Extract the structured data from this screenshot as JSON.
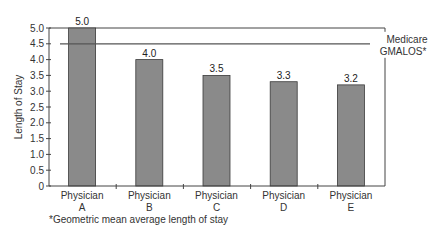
{
  "chart_data": {
    "type": "bar",
    "title": "",
    "xlabel": "",
    "ylabel": "Length of Stay",
    "ylim": [
      0,
      5.0
    ],
    "yticks": [
      "0",
      "0.5",
      "1.0",
      "1.5",
      "2.0",
      "2.5",
      "3.0",
      "3.5",
      "4.0",
      "4.5",
      "5.0"
    ],
    "categories": [
      {
        "line1": "Physician",
        "line2": "A"
      },
      {
        "line1": "Physician",
        "line2": "B"
      },
      {
        "line1": "Physician",
        "line2": "C"
      },
      {
        "line1": "Physician",
        "line2": "D"
      },
      {
        "line1": "Physician",
        "line2": "E"
      }
    ],
    "values": [
      5.0,
      4.0,
      3.5,
      3.3,
      3.2
    ],
    "value_labels": [
      "5.0",
      "4.0",
      "3.5",
      "3.3",
      "3.2"
    ],
    "reference_line": {
      "value": 4.5,
      "label_line1": "Medicare",
      "label_line2": "GMALOS*"
    },
    "footnote": "*Geometric mean average length of stay",
    "grid": false,
    "legend": "none",
    "colors": {
      "bar_fill": "#8a8a8a",
      "bar_stroke": "#3a3a3a",
      "axis": "#444444",
      "reference_line": "#555555"
    }
  }
}
